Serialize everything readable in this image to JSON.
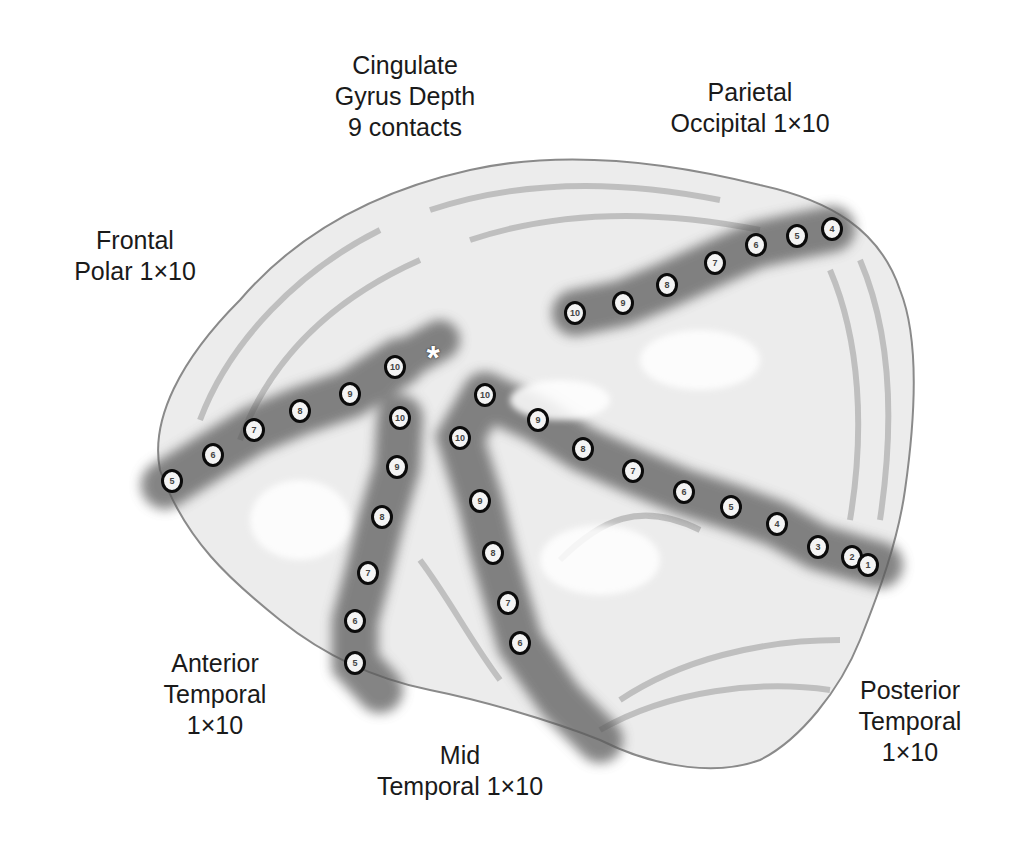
{
  "figure": {
    "type": "brain electrode placement diagram",
    "marker": "*"
  },
  "labels": {
    "cingulate": [
      "Cingulate",
      "Gyrus Depth",
      "9 contacts"
    ],
    "parietal_occipital": [
      "Parietal",
      "Occipital 1×10"
    ],
    "frontal_polar": [
      "Frontal",
      "Polar 1×10"
    ],
    "anterior_temporal": [
      "Anterior",
      "Temporal",
      "1×10"
    ],
    "mid_temporal": [
      "Mid",
      "Temporal 1×10"
    ],
    "posterior_temporal": [
      "Posterior",
      "Temporal",
      "1×10"
    ]
  },
  "electrodes": {
    "frontal_polar": [
      {
        "n": "5",
        "x": 172,
        "y": 481
      },
      {
        "n": "6",
        "x": 213,
        "y": 455
      },
      {
        "n": "7",
        "x": 254,
        "y": 430
      },
      {
        "n": "8",
        "x": 300,
        "y": 411
      },
      {
        "n": "9",
        "x": 350,
        "y": 394
      },
      {
        "n": "10",
        "x": 395,
        "y": 367
      }
    ],
    "anterior_temporal": [
      {
        "n": "10",
        "x": 400,
        "y": 418
      },
      {
        "n": "9",
        "x": 397,
        "y": 467
      },
      {
        "n": "8",
        "x": 382,
        "y": 517
      },
      {
        "n": "7",
        "x": 368,
        "y": 573
      },
      {
        "n": "6",
        "x": 355,
        "y": 621
      },
      {
        "n": "5",
        "x": 355,
        "y": 663
      }
    ],
    "mid_temporal": [
      {
        "n": "10",
        "x": 485,
        "y": 395
      },
      {
        "n": "10",
        "x": 460,
        "y": 438
      },
      {
        "n": "9",
        "x": 480,
        "y": 501
      },
      {
        "n": "8",
        "x": 493,
        "y": 553
      },
      {
        "n": "7",
        "x": 508,
        "y": 603
      },
      {
        "n": "6",
        "x": 520,
        "y": 643
      }
    ],
    "posterior_temporal": [
      {
        "n": "9",
        "x": 538,
        "y": 420
      },
      {
        "n": "8",
        "x": 583,
        "y": 449
      },
      {
        "n": "7",
        "x": 633,
        "y": 471
      },
      {
        "n": "6",
        "x": 684,
        "y": 492
      },
      {
        "n": "5",
        "x": 731,
        "y": 507
      },
      {
        "n": "4",
        "x": 777,
        "y": 524
      },
      {
        "n": "3",
        "x": 818,
        "y": 547
      },
      {
        "n": "2",
        "x": 852,
        "y": 557
      },
      {
        "n": "1",
        "x": 868,
        "y": 565
      }
    ],
    "parietal_occipital": [
      {
        "n": "10",
        "x": 575,
        "y": 313
      },
      {
        "n": "9",
        "x": 623,
        "y": 303
      },
      {
        "n": "8",
        "x": 667,
        "y": 285
      },
      {
        "n": "7",
        "x": 715,
        "y": 263
      },
      {
        "n": "6",
        "x": 756,
        "y": 245
      },
      {
        "n": "5",
        "x": 797,
        "y": 236
      },
      {
        "n": "4",
        "x": 832,
        "y": 229
      }
    ]
  }
}
